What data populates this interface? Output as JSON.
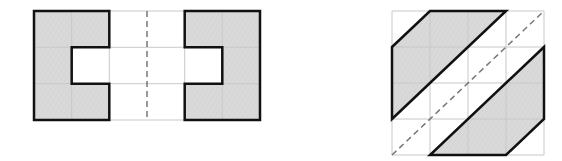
{
  "diagram": {
    "colors": {
      "fill": "#d6d6d6",
      "outline": "#111111",
      "grid": "#c8c8c8",
      "axis": "#777777",
      "background": "#ffffff"
    },
    "figures": [
      {
        "id": "left-figure",
        "description": "Two C-shaped pieces mirrored across a vertical dashed symmetry axis on a 6x3 grid",
        "grid": {
          "cols": 6,
          "rows": 3
        },
        "shapes": [
          {
            "name": "left-c-shape",
            "points_grid": [
              [
                0,
                0
              ],
              [
                2,
                0
              ],
              [
                2,
                1
              ],
              [
                1,
                1
              ],
              [
                1,
                2
              ],
              [
                2,
                2
              ],
              [
                2,
                3
              ],
              [
                0,
                3
              ]
            ]
          },
          {
            "name": "right-c-shape",
            "points_grid": [
              [
                4,
                0
              ],
              [
                6,
                0
              ],
              [
                6,
                3
              ],
              [
                4,
                3
              ],
              [
                4,
                2
              ],
              [
                5,
                2
              ],
              [
                5,
                1
              ],
              [
                4,
                1
              ]
            ]
          }
        ],
        "symmetry_axis": {
          "type": "vertical",
          "from": [
            3,
            0
          ],
          "to": [
            3,
            3
          ]
        }
      },
      {
        "id": "right-figure",
        "description": "Two parallelogram-like hexagons mirrored across a diagonal dashed symmetry axis on a 4x4 grid",
        "grid": {
          "cols": 4,
          "rows": 4
        },
        "shapes": [
          {
            "name": "upper-left-shape",
            "points_grid": [
              [
                0,
                1
              ],
              [
                1,
                0
              ],
              [
                3,
                0
              ],
              [
                0,
                3
              ]
            ]
          },
          {
            "name": "lower-right-shape",
            "points_grid": [
              [
                4,
                1
              ],
              [
                4,
                3
              ],
              [
                3,
                4
              ],
              [
                1,
                4
              ]
            ]
          }
        ],
        "symmetry_axis": {
          "type": "diagonal",
          "from": [
            0,
            4
          ],
          "to": [
            4,
            0
          ]
        }
      }
    ]
  }
}
